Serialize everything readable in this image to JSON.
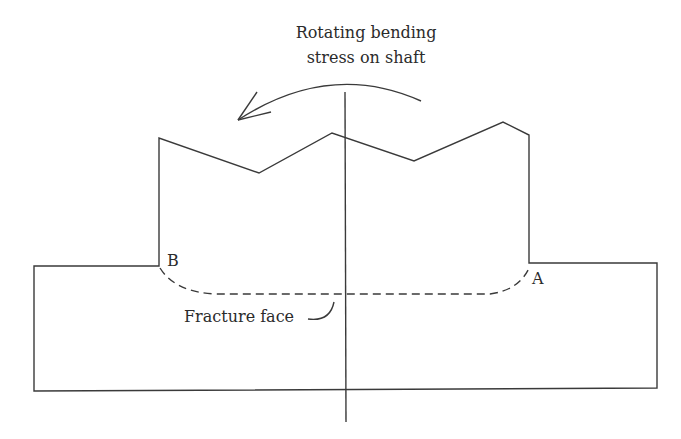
{
  "diagram": {
    "title_line1": "Rotating bending",
    "title_line2": "stress on shaft",
    "label_b": "B",
    "label_a": "A",
    "fracture_label": "Fracture face",
    "line_color": "#3a3a3a",
    "text_color": "#2b2b2b"
  }
}
